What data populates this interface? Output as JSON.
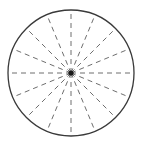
{
  "figure": {
    "name": "spoked-circle-diagram",
    "background_color": "#ffffff",
    "canvas": {
      "width": 144,
      "height": 147
    }
  },
  "circle": {
    "label": "outer-circle",
    "center_x": 71,
    "center_y": 73,
    "radius": 63,
    "stroke_color": "#3a3a3a",
    "stroke_width": 1.3,
    "fill": "none"
  },
  "hub": {
    "label": "center-hub",
    "center_x": 71,
    "center_y": 73,
    "radius": 2.6,
    "color": "#1a1a1a"
  },
  "spokes": {
    "label": "radial-spokes",
    "count": 16,
    "angle_step_degrees": 22.5,
    "stroke_color": "#6e6e6e",
    "stroke_width": 1.0,
    "dash_length": 5,
    "gap_length": 4,
    "angles_degrees": [
      0,
      22.5,
      45,
      67.5,
      90,
      112.5,
      135,
      157.5,
      180,
      202.5,
      225,
      247.5,
      270,
      292.5,
      315,
      337.5
    ]
  },
  "chart_data": {
    "type": "line",
    "subtitle": "",
    "xlabel": "",
    "ylabel": "",
    "xlim": [
      -63,
      63
    ],
    "ylim": [
      -63,
      63
    ],
    "grid": false,
    "legend": "none",
    "annotations": [],
    "series": [
      {
        "name": "outer-circle",
        "kind": "circle",
        "center": [
          71,
          73
        ],
        "radius": 63,
        "style": "solid",
        "color": "#3a3a3a"
      },
      {
        "name": "radial-spokes",
        "kind": "radii",
        "center": [
          71,
          73
        ],
        "radius": 63,
        "style": "dashed",
        "color": "#6e6e6e",
        "values": [
          0,
          22.5,
          45,
          67.5,
          90,
          112.5,
          135,
          157.5,
          180,
          202.5,
          225,
          247.5,
          270,
          292.5,
          315,
          337.5
        ]
      }
    ]
  }
}
